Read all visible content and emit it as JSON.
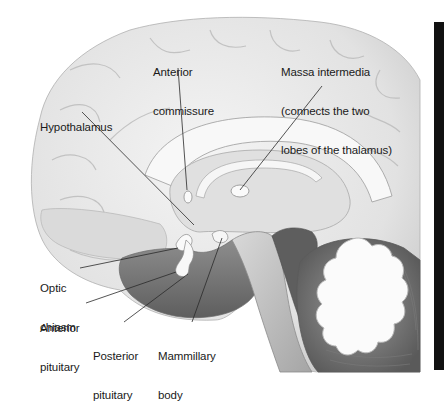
{
  "diagram": {
    "labels": [
      {
        "id": "anterior-commissure",
        "lines": [
          "Anterior",
          "commissure"
        ]
      },
      {
        "id": "massa-intermedia",
        "lines": [
          "Massa intermedia",
          "(connects the two",
          "lobes of the thalamus)"
        ]
      },
      {
        "id": "hypothalamus",
        "lines": [
          "Hypothalamus"
        ]
      },
      {
        "id": "optic-chiasm",
        "lines": [
          "Optic",
          "chiasm"
        ]
      },
      {
        "id": "anterior-pituitary",
        "lines": [
          "Anterior",
          "pituitary"
        ]
      },
      {
        "id": "posterior-pituitary",
        "lines": [
          "Posterior",
          "pituitary"
        ]
      },
      {
        "id": "mammillary-body",
        "lines": [
          "Mammillary",
          "body"
        ]
      }
    ],
    "colors": {
      "background": "#ffffff",
      "cortex": "#e9e9e9",
      "cortex_shadow": "#bdbdbd",
      "white_matter": "#f7f7f7",
      "dark_tissue": "#6e6e6e",
      "brainstem": "#8a8a8a",
      "leader_line": "#2a2a2a",
      "side_bar": "#111111"
    }
  }
}
